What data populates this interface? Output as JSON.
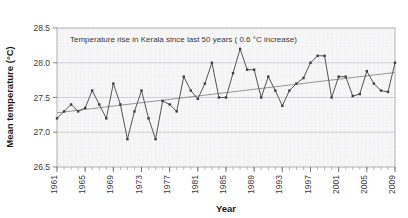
{
  "chart_data": {
    "type": "line",
    "title": "Temperature rise in Kerala since last  50  years ( 0.6 °C increase)",
    "xlabel": "Year",
    "ylabel": "Mean temperature (°C)",
    "ylim": [
      26.5,
      28.5
    ],
    "ytick_values": [
      26.5,
      27.0,
      27.5,
      28.0,
      28.5
    ],
    "ytick_labels": [
      "26.5",
      "27.0",
      "27.5",
      "28.0",
      "28.5"
    ],
    "xlim": [
      1961,
      2009
    ],
    "xtick_labels": [
      "1961",
      "1965",
      "1969",
      "1973",
      "1977",
      "1981",
      "1985",
      "1989",
      "1993",
      "1997",
      "2001",
      "2005",
      "2009"
    ],
    "xtick_values": [
      1961,
      1965,
      1969,
      1973,
      1977,
      1981,
      1985,
      1989,
      1993,
      1997,
      2001,
      2005,
      2009
    ],
    "x_minor_tick_step": 1,
    "grid": "horizontal-major-only",
    "legend": "none",
    "marker": "small-filled-square",
    "series": [
      {
        "name": "Mean temperature",
        "color": "#555555",
        "x": [
          1961,
          1962,
          1963,
          1964,
          1965,
          1966,
          1967,
          1968,
          1969,
          1970,
          1971,
          1972,
          1973,
          1974,
          1975,
          1976,
          1977,
          1978,
          1979,
          1980,
          1981,
          1982,
          1983,
          1984,
          1985,
          1986,
          1987,
          1988,
          1989,
          1990,
          1991,
          1992,
          1993,
          1994,
          1995,
          1996,
          1997,
          1998,
          1999,
          2000,
          2001,
          2002,
          2003,
          2004,
          2005,
          2006,
          2007,
          2008,
          2009
        ],
        "values": [
          27.2,
          27.3,
          27.4,
          27.3,
          27.35,
          27.6,
          27.4,
          27.2,
          27.7,
          27.4,
          26.9,
          27.3,
          27.6,
          27.2,
          26.9,
          27.45,
          27.4,
          27.3,
          27.8,
          27.6,
          27.48,
          27.7,
          28.0,
          27.5,
          27.5,
          27.85,
          28.2,
          27.9,
          27.9,
          27.5,
          27.8,
          27.6,
          27.38,
          27.6,
          27.7,
          27.78,
          28.0,
          28.1,
          28.1,
          27.5,
          27.8,
          27.8,
          27.52,
          27.55,
          27.88,
          27.7,
          27.6,
          27.58,
          28.0
        ]
      },
      {
        "name": "Linear trend",
        "color": "#8a8a8a",
        "type": "trendline",
        "x": [
          1961,
          2009
        ],
        "values": [
          27.28,
          27.86
        ]
      }
    ]
  },
  "figure": {
    "background_color": "#ffffff",
    "plot_background_color": "#f7f7f7",
    "border_color": "#aaaaaa",
    "gridline_color": "#c8c8d0"
  }
}
